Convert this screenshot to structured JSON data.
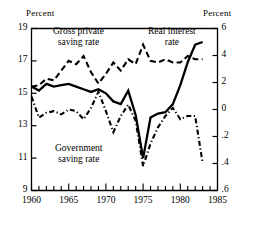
{
  "axes": {
    "left_unit": "Percent",
    "right_unit": "Percent",
    "left_ticks": [
      "19",
      "17",
      "15",
      "13",
      "11",
      "9"
    ],
    "right_ticks": [
      "6",
      "4",
      "2",
      "0",
      ".2",
      ".4",
      ".6"
    ],
    "x_ticks": [
      "1960",
      "1965",
      "1970",
      "1975",
      "1980",
      "1985"
    ]
  },
  "labels": {
    "gross": "Gross private\nsaving rate",
    "gross_l1": "Gross private",
    "gross_l2": "saving rate",
    "real_l1": "Real interest",
    "real_l2": "rate",
    "govt_l1": "Government",
    "govt_l2": "saving rate"
  },
  "colors": {
    "ink": "#000000",
    "paper": "#ffffff"
  },
  "chart_data": {
    "type": "line",
    "title": "",
    "xlabel": "",
    "ylabel": "Percent",
    "y2label": "Percent",
    "xlim": [
      1960,
      1985
    ],
    "ylim": [
      9,
      19
    ],
    "y2lim": [
      -6,
      6
    ],
    "grid": false,
    "legend": "inline-annotations",
    "x": [
      1960,
      1961,
      1962,
      1963,
      1964,
      1965,
      1966,
      1967,
      1968,
      1969,
      1970,
      1971,
      1972,
      1973,
      1974,
      1975,
      1976,
      1977,
      1978,
      1979,
      1980,
      1981,
      1982,
      1983
    ],
    "series": [
      {
        "name": "Gross private saving rate",
        "axis": "left",
        "style": "dashed",
        "unit": "percent",
        "values": [
          15.4,
          15.5,
          15.9,
          15.8,
          16.4,
          17.0,
          16.8,
          17.3,
          16.3,
          15.6,
          16.2,
          16.9,
          16.4,
          17.1,
          16.8,
          18.0,
          17.0,
          16.9,
          17.1,
          16.9,
          16.9,
          17.3,
          17.1,
          17.1
        ]
      },
      {
        "name": "Real interest rate",
        "axis": "right",
        "style": "solid",
        "unit": "percent",
        "values": [
          1.7,
          1.4,
          1.9,
          1.7,
          1.8,
          1.9,
          1.7,
          1.5,
          1.3,
          1.5,
          1.2,
          0.6,
          0.4,
          1.4,
          -0.4,
          -3.6,
          -0.6,
          -0.3,
          -0.2,
          0.4,
          1.8,
          3.5,
          4.8,
          5.0
        ]
      },
      {
        "name": "Government saving rate",
        "axis": "left",
        "style": "dash-dot",
        "unit": "percent",
        "values": [
          14.8,
          13.5,
          13.8,
          13.9,
          13.7,
          14.0,
          13.9,
          13.4,
          14.1,
          15.1,
          13.9,
          12.6,
          13.6,
          14.3,
          13.3,
          10.5,
          11.9,
          12.9,
          13.6,
          14.1,
          13.4,
          13.6,
          13.6,
          10.7
        ]
      }
    ],
    "annotations": [
      {
        "text": "Gross private saving rate",
        "x": 1967,
        "y": 18.6
      },
      {
        "text": "Real interest rate",
        "x": 1980,
        "y": 18.6
      },
      {
        "text": "Government saving rate",
        "x": 1967,
        "y": 11.8
      }
    ]
  }
}
